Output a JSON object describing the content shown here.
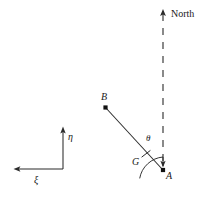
{
  "figure": {
    "type": "geometry-diagram",
    "background_color": "#ffffff",
    "stroke_color": "#2b2b2b",
    "text_color": "#1a1a1a",
    "width": 208,
    "height": 197,
    "labels": {
      "north": "North",
      "point_a": "A",
      "point_b": "B",
      "point_g": "G",
      "angle_theta": "θ",
      "axis_xi": "ξ",
      "axis_eta": "η"
    },
    "points": [
      {
        "name": "A",
        "label": "A",
        "x": 163,
        "y": 170,
        "marker": "filled-dot"
      },
      {
        "name": "B",
        "label": "B",
        "x": 105,
        "y": 107,
        "marker": "filled-dot"
      },
      {
        "name": "G",
        "label": "G",
        "x": 146,
        "y": 157,
        "marker": "tick"
      }
    ],
    "lines": [
      {
        "name": "segment-AB",
        "from": "B",
        "to": "A",
        "style": "solid"
      },
      {
        "name": "north-line",
        "from_x": 163,
        "from_y": 13,
        "to_x": 163,
        "to_y": 168,
        "style": "dashed"
      }
    ],
    "arrows": [
      {
        "name": "north-arrow",
        "direction": "up",
        "x": 163,
        "y": 11
      },
      {
        "name": "north-line-arrow",
        "direction": "down",
        "x": 163,
        "y": 167
      },
      {
        "name": "eta-axis-arrow",
        "direction": "up",
        "x": 63,
        "y": 128
      },
      {
        "name": "xi-axis-arrow",
        "direction": "left",
        "x": 15,
        "y": 169
      }
    ],
    "angle_arc": {
      "name": "theta-arc",
      "vertex_x": 146,
      "vertex_y": 157,
      "radius": 26,
      "between": [
        "segment-GA",
        "north-line"
      ]
    },
    "axes": {
      "origin_x": 63,
      "origin_y": 169,
      "eta_tip_y": 128,
      "xi_tip_x": 15
    }
  }
}
